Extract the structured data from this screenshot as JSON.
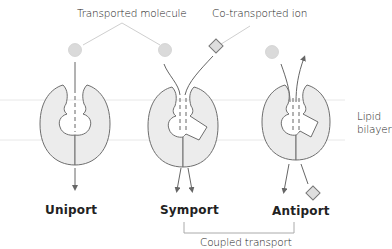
{
  "labels": {
    "transported_molecule": "Transported molecule",
    "cotransported_ion": "Co-transported ion",
    "lipid_bilayer_line1": "Lipid",
    "lipid_bilayer_line2": "bilayer",
    "coupled_transport": "Coupled transport"
  },
  "transporters": [
    {
      "name": "Uniport",
      "molecules": [
        "molecule"
      ],
      "direction": "same-direction inward"
    },
    {
      "name": "Symport",
      "molecules": [
        "molecule",
        "ion"
      ],
      "direction": "both move same direction"
    },
    {
      "name": "Antiport",
      "molecules": [
        "molecule",
        "ion"
      ],
      "direction": "opposite directions"
    }
  ],
  "colors": {
    "protein_fill": "#ebebeb",
    "outline": "#6e6e6e",
    "molecule_fill": "#d9d9d9",
    "leader_line": "#c8c8c8",
    "membrane_line": "#e6e6e6",
    "text": "#222222"
  }
}
